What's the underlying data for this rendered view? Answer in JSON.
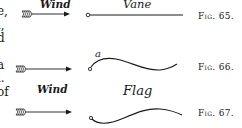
{
  "left_margin_text": {
    "lines": [
      "e,",
      "l,",
      "d",
      "a",
      "l.",
      "of"
    ]
  },
  "figures": [
    {
      "id": "fig-65",
      "caption": "Fig. 65.",
      "arrow_label": "Wind",
      "object_label": "Vane",
      "shape": "straight"
    },
    {
      "id": "fig-66",
      "caption": "Fig. 66.",
      "point_label": "a",
      "shape": "wavy-up-down"
    },
    {
      "id": "fig-67",
      "caption": "Fig. 67.",
      "arrow_label": "Wind",
      "object_label": "Flag",
      "shape": "wavy-down-up"
    }
  ],
  "colors": {
    "ink": "#1a1a1a",
    "paper": "#ffffff"
  }
}
